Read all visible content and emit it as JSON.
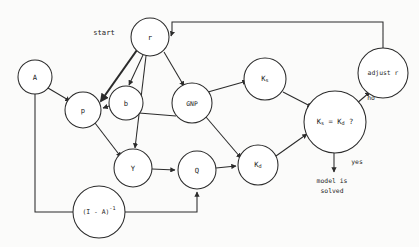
{
  "diagram": {
    "type": "flowchart",
    "canvas": {
      "width": 419,
      "height": 247
    },
    "stroke_color": "#2b2b2b",
    "background_color": "#fbfbfa",
    "nodes": [
      {
        "id": "r",
        "label": "r",
        "cx": 150,
        "cy": 37,
        "r": 19
      },
      {
        "id": "A",
        "label": "A",
        "cx": 35,
        "cy": 77,
        "r": 17
      },
      {
        "id": "p",
        "label": "p",
        "cx": 83,
        "cy": 110,
        "r": 18
      },
      {
        "id": "b",
        "label": "b",
        "cx": 126,
        "cy": 103,
        "r": 17
      },
      {
        "id": "GNP",
        "label": "GNP",
        "cx": 192,
        "cy": 103,
        "r": 20
      },
      {
        "id": "Ks",
        "label": "K",
        "sub": "s",
        "cx": 265,
        "cy": 79,
        "r": 21
      },
      {
        "id": "decision",
        "label": "K",
        "sub": "s",
        "label2": " = K",
        "sub2": "d",
        "label3": " ?",
        "cx": 335,
        "cy": 122,
        "r": 31
      },
      {
        "id": "adjust",
        "label": "adjust r",
        "cx": 383,
        "cy": 73,
        "r": 25
      },
      {
        "id": "Y",
        "label": "Y",
        "cx": 133,
        "cy": 168,
        "r": 19
      },
      {
        "id": "Q",
        "label": "Q",
        "cx": 197,
        "cy": 170,
        "r": 19
      },
      {
        "id": "Kd",
        "label": "K",
        "sub": "d",
        "cx": 258,
        "cy": 165,
        "r": 20
      },
      {
        "id": "leontief",
        "label": "(I - A)",
        "sup": "-1",
        "cx": 99,
        "cy": 212,
        "r": 26
      }
    ],
    "free_labels": [
      {
        "id": "start",
        "text": "start",
        "x": 104,
        "y": 33
      },
      {
        "id": "no",
        "text": "no",
        "x": 371,
        "y": 98
      },
      {
        "id": "yes",
        "text": "yes",
        "x": 357,
        "y": 162
      },
      {
        "id": "solved-1",
        "text": "model is",
        "x": 332,
        "y": 181
      },
      {
        "id": "solved-2",
        "text": "solved",
        "x": 332,
        "y": 191
      }
    ],
    "edges": [
      {
        "from": "start",
        "to": "p",
        "arrow": true,
        "thick": true
      },
      {
        "from": "r",
        "to": "b",
        "arrow": true,
        "thick": false
      },
      {
        "from": "r",
        "to": "GNP",
        "arrow": true,
        "thick": false
      },
      {
        "from": "r",
        "to": "Y",
        "arrow": true,
        "thick": false
      },
      {
        "from": "A",
        "to": "p",
        "arrow": true,
        "thick": false
      },
      {
        "from": "A",
        "to": "leontief",
        "arrow": false,
        "thick": false
      },
      {
        "from": "b",
        "to": "p",
        "arrow": true,
        "thick": false
      },
      {
        "from": "b",
        "to": "GNP",
        "arrow": false,
        "thick": false
      },
      {
        "from": "p",
        "to": "Y",
        "arrow": true,
        "thick": false
      },
      {
        "from": "GNP",
        "to": "Ks",
        "arrow": true,
        "thick": false
      },
      {
        "from": "GNP",
        "to": "Kd",
        "arrow": true,
        "thick": false
      },
      {
        "from": "Ks",
        "to": "decision",
        "arrow": true,
        "thick": false
      },
      {
        "from": "Y",
        "to": "Q",
        "arrow": true,
        "thick": false
      },
      {
        "from": "Q",
        "to": "Kd",
        "arrow": true,
        "thick": false
      },
      {
        "from": "Kd",
        "to": "decision",
        "arrow": true,
        "thick": false
      },
      {
        "from": "decision",
        "to": "adjust",
        "arrow": true,
        "label": "no"
      },
      {
        "from": "decision",
        "to": "solved",
        "arrow": true,
        "label": "yes"
      },
      {
        "from": "adjust",
        "to": "r",
        "arrow": true,
        "thick": false
      },
      {
        "from": "leontief",
        "to": "Q",
        "arrow": true,
        "thick": false
      }
    ]
  }
}
